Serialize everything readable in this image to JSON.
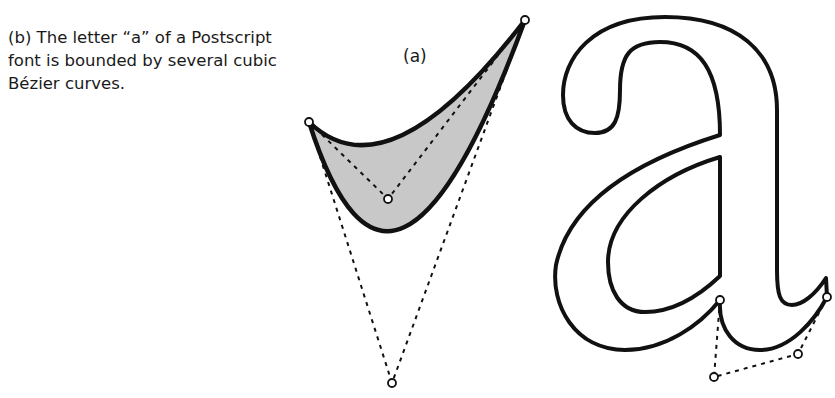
{
  "figure": {
    "caption_b": "(b) The letter “a” of a Postscript font is bounded by several cubic Bézier curves.",
    "label_a": "(a)"
  },
  "diagram_a": {
    "description": "Shaded region bounded by two Bezier curves sharing endpoints, with dashed control polygons",
    "fill_color": "#c8c8c8",
    "stroke_color": "#111111",
    "endpoints": [
      [
        309,
        122
      ],
      [
        525,
        20
      ]
    ],
    "upper_curve_control": [
      388,
      199
    ],
    "lower_curve_control": [
      392,
      383
    ]
  },
  "diagram_b": {
    "description": "Outline of lowercase letter a with one cubic Bezier segment's control points shown",
    "stroke_color": "#111111",
    "control_points": [
      [
        720,
        300
      ],
      [
        714,
        377
      ],
      [
        798,
        354
      ],
      [
        827,
        297
      ]
    ]
  }
}
